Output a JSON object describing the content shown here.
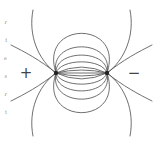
{
  "diagram": {
    "type": "electric-dipole-field-lines",
    "stroke_color": "#555555",
    "charges": [
      {
        "name": "positive",
        "sign_label": "+",
        "x": 56,
        "y": 73,
        "label_x": 26,
        "label_y": 73
      },
      {
        "name": "negative",
        "sign_label": "−",
        "x": 107,
        "y": 73,
        "label_x": 133,
        "label_y": 73
      }
    ],
    "inner_arcs_offsets": [
      3,
      7,
      12,
      18,
      26,
      36
    ],
    "outer_lines": {
      "left_angles_deg": [
        150,
        165,
        195,
        210
      ],
      "right_angles_deg": [
        30,
        15,
        -15,
        -30
      ]
    },
    "margin_fragments": [
      "r",
      "f",
      "e",
      "s",
      "r",
      "t"
    ]
  }
}
